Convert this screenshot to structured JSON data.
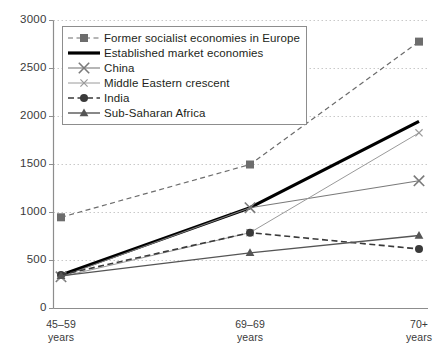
{
  "chart_data": {
    "type": "line",
    "title": "",
    "xlabel": "",
    "ylabel": "",
    "categories": [
      "45–59\nyears",
      "69–69\nyears",
      "70+\nyears"
    ],
    "x_tick_labels": [
      {
        "line1": "45–59",
        "line2": "years"
      },
      {
        "line1": "69–69",
        "line2": "years"
      },
      {
        "line1": "70+",
        "line2": "years"
      }
    ],
    "y_tick_labels": [
      "0",
      "500",
      "1000",
      "1500",
      "2000",
      "2500",
      "3000"
    ],
    "y_ticks": [
      0,
      500,
      1000,
      1500,
      2000,
      2500,
      3000
    ],
    "ylim": [
      0,
      3000
    ],
    "grid": true,
    "grid_style": "dotted",
    "legend_position": "upper-left-inside",
    "series": [
      {
        "name": "Former socialist economies in Europe",
        "values": [
          950,
          1500,
          2780
        ],
        "line_style": "dashed",
        "marker": "square",
        "color": "#6d6d6d",
        "width": 1.2
      },
      {
        "name": "Established market economies",
        "values": [
          350,
          1050,
          1950
        ],
        "line_style": "solid",
        "marker": "none",
        "color": "#000000",
        "width": 3.2
      },
      {
        "name": "China",
        "values": [
          330,
          1050,
          1330
        ],
        "line_style": "solid",
        "marker": "x-large",
        "color": "#7a7a7a",
        "width": 1.1
      },
      {
        "name": "Middle Eastern crescent",
        "values": [
          330,
          790,
          1830
        ],
        "line_style": "solid",
        "marker": "x-small",
        "color": "#9a9a9a",
        "width": 1.0
      },
      {
        "name": "India",
        "values": [
          350,
          790,
          620
        ],
        "line_style": "dashed",
        "marker": "circle",
        "color": "#3a3a3a",
        "width": 1.6
      },
      {
        "name": "Sub-Saharan Africa",
        "values": [
          340,
          580,
          760
        ],
        "line_style": "solid",
        "marker": "triangle",
        "color": "#555555",
        "width": 1.4
      }
    ]
  },
  "axes": {
    "axis_color": "#8d8d8d",
    "grid_color": "#c9c9c9"
  }
}
